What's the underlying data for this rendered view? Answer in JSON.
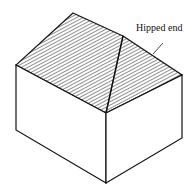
{
  "diagram": {
    "labels": [
      {
        "id": "hipped-end",
        "text": "Hipped end"
      }
    ],
    "colors": {
      "line": "#111111",
      "hatch": "#333333",
      "background": "#ffffff"
    }
  }
}
